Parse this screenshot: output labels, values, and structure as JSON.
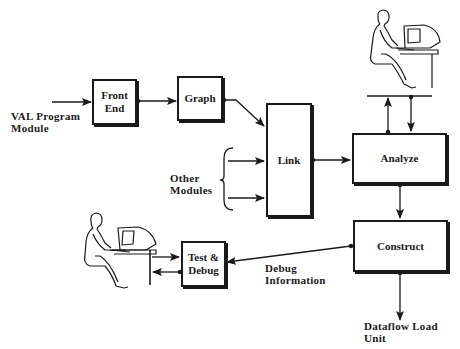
{
  "diagram": {
    "type": "flowchart",
    "colors": {
      "ink": "#1a1a1a",
      "background": "#ffffff"
    },
    "nodes": {
      "front_end": {
        "line1": "Front",
        "line2": "End"
      },
      "graph": {
        "label": "Graph"
      },
      "link": {
        "label": "Link"
      },
      "analyze": {
        "label": "Analyze"
      },
      "construct": {
        "label": "Construct"
      },
      "test_debug": {
        "line1": "Test &",
        "line2": "Debug"
      }
    },
    "labels": {
      "val_program_module": {
        "line1": "VAL Program",
        "line2": "Module"
      },
      "other_modules": {
        "line1": "Other",
        "line2": "Modules"
      },
      "debug_information": {
        "line1": "Debug",
        "line2": "Information"
      },
      "dataflow_load_unit": {
        "line1": "Dataflow Load",
        "line2": "Unit"
      }
    },
    "icons": {
      "top_right": "person-at-terminal-icon",
      "bottom_left": "person-at-terminal-icon"
    },
    "edges": [
      {
        "from": "VAL Program Module",
        "to": "Front End"
      },
      {
        "from": "Front End",
        "to": "Graph"
      },
      {
        "from": "Graph",
        "to": "Link"
      },
      {
        "from": "Other Modules",
        "to": "Link",
        "count": 2
      },
      {
        "from": "Link",
        "to": "Analyze"
      },
      {
        "from": "Analyze",
        "to": "User (top)",
        "bidirectional": true
      },
      {
        "from": "Analyze",
        "to": "Construct"
      },
      {
        "from": "Construct",
        "to": "Test & Debug",
        "label": "Debug Information"
      },
      {
        "from": "Test & Debug",
        "to": "User (left)",
        "bidirectional": true
      },
      {
        "from": "Construct",
        "to": "Dataflow Load Unit"
      }
    ]
  }
}
